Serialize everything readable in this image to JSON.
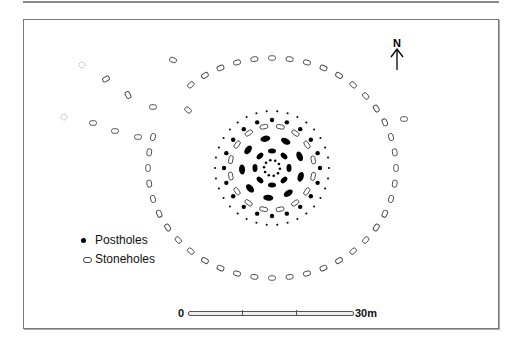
{
  "diagram": {
    "north_label": "N",
    "legend": [
      {
        "symbol": "filled-dot",
        "label": "Postholes"
      },
      {
        "symbol": "outline-stone",
        "label": "Stoneholes"
      }
    ],
    "scale_bar": {
      "start_label": "0",
      "end_label": "30m",
      "divisions": 3
    },
    "colors": {
      "ink": "#000000",
      "frame": "#7a7a7a",
      "background": "#ffffff"
    }
  }
}
